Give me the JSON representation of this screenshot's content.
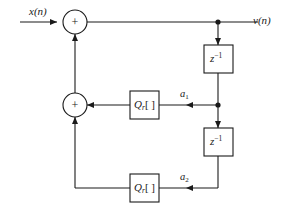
{
  "diagram": {
    "type": "signal-flow-graph",
    "ink_color": "#1a1a1a",
    "background_color": "#ffffff",
    "signals": {
      "input_label": "x(n)",
      "output_label": "v(n)"
    },
    "adders": [
      {
        "id": "adder-top",
        "symbol": "+",
        "cx": 75,
        "cy": 22,
        "r": 12
      },
      {
        "id": "adder-mid",
        "symbol": "+",
        "cx": 75,
        "cy": 105,
        "r": 12
      }
    ],
    "delay_blocks": [
      {
        "id": "delay-1",
        "base": "z",
        "exponent": "−1",
        "label": "z−1",
        "x": 204,
        "y": 45,
        "w": 29,
        "h": 28
      },
      {
        "id": "delay-2",
        "base": "z",
        "exponent": "−1",
        "label": "z−1",
        "x": 204,
        "y": 128,
        "w": 29,
        "h": 28
      }
    ],
    "quantizer_blocks": [
      {
        "id": "quantizer-1",
        "base": "Q",
        "subscript": "r",
        "brackets": "[ ]",
        "label": "Qr[ ]",
        "x": 130,
        "y": 91,
        "w": 29,
        "h": 28
      },
      {
        "id": "quantizer-2",
        "base": "Q",
        "subscript": "r",
        "brackets": "[ ]",
        "label": "Qr[ ]",
        "x": 130,
        "y": 174,
        "w": 29,
        "h": 28
      }
    ],
    "coefficients": [
      {
        "id": "coef-a1",
        "base": "a",
        "subscript": "1",
        "label": "a1"
      },
      {
        "id": "coef-a2",
        "base": "a",
        "subscript": "2",
        "label": "a2"
      }
    ],
    "junctions": [
      {
        "id": "junction-output",
        "cx": 218,
        "cy": 22
      },
      {
        "id": "junction-middle",
        "cx": 218,
        "cy": 105
      }
    ]
  }
}
